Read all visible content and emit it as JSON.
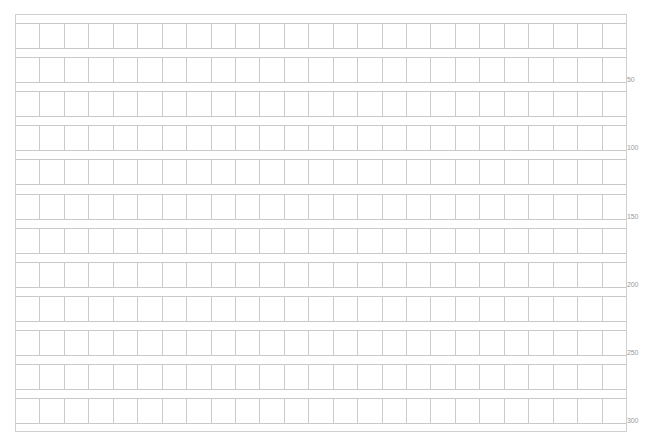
{
  "sheet": {
    "type": "genkou-youshi",
    "title": "",
    "columns": 25,
    "rows": 12,
    "line_color": "#c9c9c9",
    "row_labels": [
      {
        "after_row": 2,
        "text": "50"
      },
      {
        "after_row": 4,
        "text": "100"
      },
      {
        "after_row": 6,
        "text": "150"
      },
      {
        "after_row": 8,
        "text": "200"
      },
      {
        "after_row": 10,
        "text": "250"
      },
      {
        "after_row": 12,
        "text": "300"
      }
    ]
  }
}
